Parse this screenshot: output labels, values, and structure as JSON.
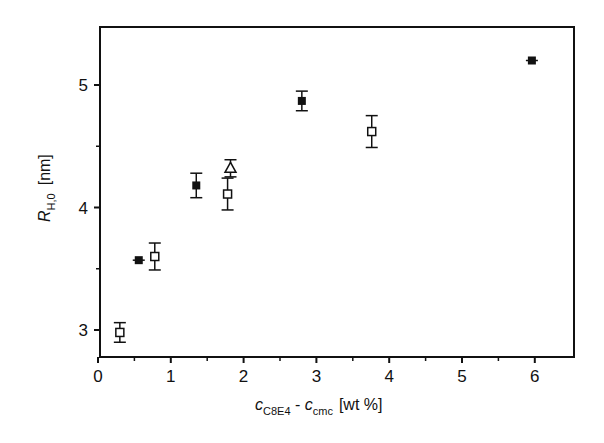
{
  "chart_data": {
    "type": "scatter",
    "title": "",
    "xlabel": "c_C8E4 - c_cmc [wt %]",
    "xlabel_parts": {
      "main": "c",
      "sub1": "C8E4",
      "dash": " - ",
      "main2": "c",
      "sub2": "cmc",
      "unit": "[wt %]"
    },
    "ylabel": "R_H,0 [nm]",
    "ylabel_parts": {
      "main": "R",
      "sub": "H,0",
      "unit": "[nm]"
    },
    "xlim": [
      0,
      6.5
    ],
    "ylim": [
      2.78,
      5.47
    ],
    "xticks": [
      0,
      1,
      2,
      3,
      4,
      5,
      6
    ],
    "xtick_labels": [
      "0",
      "1",
      "2",
      "3",
      "4",
      "5",
      "6"
    ],
    "xminor": [
      0.5,
      1.5,
      2.5,
      3.5,
      4.5,
      5.5
    ],
    "yticks": [
      3,
      4,
      5
    ],
    "ytick_labels": [
      "3",
      "4",
      "5"
    ],
    "yminor": [
      3.5,
      4.5
    ],
    "grid": false,
    "legend": null,
    "series": [
      {
        "name": "filled squares",
        "marker": "filled-square",
        "points": [
          {
            "x": 0.56,
            "y": 3.57,
            "err": 0.02
          },
          {
            "x": 1.35,
            "y": 4.18,
            "err": 0.1
          },
          {
            "x": 2.8,
            "y": 4.87,
            "err": 0.08
          },
          {
            "x": 5.96,
            "y": 5.2,
            "err": 0.02
          }
        ]
      },
      {
        "name": "open squares",
        "marker": "open-square",
        "points": [
          {
            "x": 0.3,
            "y": 2.98,
            "err": 0.08
          },
          {
            "x": 0.78,
            "y": 3.6,
            "err": 0.11
          },
          {
            "x": 1.78,
            "y": 4.11,
            "err": 0.13
          },
          {
            "x": 3.76,
            "y": 4.62,
            "err": 0.13
          }
        ]
      },
      {
        "name": "open triangle",
        "marker": "open-triangle",
        "points": [
          {
            "x": 1.82,
            "y": 4.32,
            "err": 0.07
          }
        ]
      }
    ]
  }
}
